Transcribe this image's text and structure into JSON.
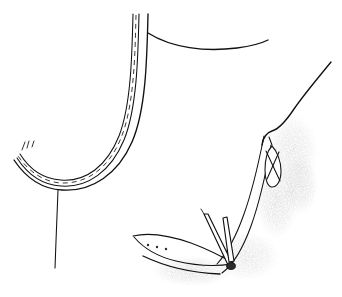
{
  "figure": {
    "caption": "",
    "background_color": "#ffffff",
    "ink_color": "#111111",
    "shading_color": "#9a9a9a",
    "width": 342,
    "height": 297,
    "style": "pen-and-ink medical illustration"
  },
  "elements": {
    "tube": {
      "label": "curved tubular structure",
      "description": "U-shaped tube with two solid walls and a dashed centerline",
      "outer_wall_path": "M 148 14 C 147 58, 146 110, 132 142 C 118 174, 92 192, 62 190 C 42 189, 26 178, 14 160",
      "inner_wall_path": "M 136 14 C 135 56, 134 106, 121 137 C 108 167, 86 183, 60 181 C 42 180, 27 170, 16 153",
      "mid_wall_path": "M 142 14 C 141 57, 140 108, 127 140 C 113 171, 89 188, 61 186 C 42 185, 26 174, 15 157",
      "centerline_path": "M 142 15 C 141 57, 140 107, 126 139 C 112 170, 88 186, 61 184 C 43 183, 27 172, 16 155",
      "stub_top_a": "M 22 148 L 25 141",
      "stub_top_b": "M 27 146 L 29 139",
      "stub_top_c": "M 31 145 L 33 139"
    },
    "descending_line": {
      "label": "thin vertical suture strand",
      "path": "M 58 190 C 57 212, 56 242, 55 268"
    },
    "top_contour": {
      "label": "upper tissue margin arc",
      "path": "M 149 34 C 172 48, 205 52, 237 48 C 252 46, 262 43, 268 40"
    },
    "right_contour": {
      "label": "right tissue contour",
      "path": "M 331 62 C 318 78, 304 94, 293 110 C 285 122, 279 129, 272 131 C 266 132, 263 136, 262 144"
    },
    "right_inner_edge": {
      "label": "right inner tissue edge",
      "path": "M 264 135 C 258 160, 252 188, 243 214 C 236 234, 227 252, 216 264"
    },
    "right_lower_edge": {
      "label": "right lower tissue fold",
      "path": "M 271 144 C 266 172, 260 200, 251 226 C 243 248, 233 264, 222 273"
    },
    "flap": {
      "label": "tissue flap with marking dots",
      "outline_top": "M 133 236 C 150 232, 170 235, 190 243 C 206 249, 220 256, 232 263",
      "outline_bottom": "M 134 237 C 144 249, 158 257, 175 261 C 192 265, 212 267, 231 264",
      "dots": [
        {
          "cx": 148,
          "cy": 245,
          "r": 1.2
        },
        {
          "cx": 157,
          "cy": 247,
          "r": 1.2
        },
        {
          "cx": 166,
          "cy": 249,
          "r": 1.2
        }
      ]
    },
    "ground_line": {
      "label": "lower tissue base line",
      "path": "M 143 256 C 165 266, 192 273, 219 274"
    },
    "needle_left": {
      "label": "angled surgical needle",
      "shaft": "M 205 216 L 228 264",
      "shaft_b": "M 208 215 L 231 263",
      "tip": "M 205 216 L 203 212"
    },
    "needle_right": {
      "label": "vertical surgical needle with knob",
      "shaft": "M 224 219 L 230 262",
      "shaft_b": "M 227 219 L 233 262",
      "knob": {
        "cx": 231,
        "cy": 266,
        "rx": 4.2,
        "ry": 3.4
      }
    },
    "loop": {
      "label": "elongated suture loop",
      "outline": "M 272 146 C 277 150, 281 160, 281 171 C 281 180, 277 186, 272 186 C 268 186, 265 179, 265 170 C 265 159, 268 150, 272 146 Z",
      "cross_a": "M 266 150 L 279 180",
      "cross_b": "M 279 151 L 267 178",
      "tail": "M 272 144 L 270 138"
    },
    "shading": {
      "label": "stippled gray shading region",
      "tone": "#a6a6a6",
      "regions": [
        {
          "name": "upper-right-stipple",
          "cx": 292,
          "cy": 150,
          "rx": 26,
          "ry": 34
        },
        {
          "name": "mid-right-stipple",
          "cx": 276,
          "cy": 200,
          "rx": 22,
          "ry": 36
        },
        {
          "name": "lower-stipple",
          "cx": 244,
          "cy": 258,
          "rx": 34,
          "ry": 22
        },
        {
          "name": "bottom-left-stipple",
          "cx": 190,
          "cy": 272,
          "rx": 38,
          "ry": 14
        }
      ]
    }
  }
}
